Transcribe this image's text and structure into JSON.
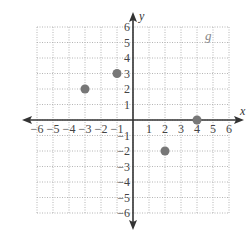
{
  "chart_data": {
    "type": "scatter",
    "title": "",
    "xlabel": "x",
    "ylabel": "y",
    "xlim": [
      -6,
      6
    ],
    "ylim": [
      -6,
      6
    ],
    "grid": true,
    "x_ticks": [
      -6,
      -5,
      -4,
      -3,
      -2,
      -1,
      1,
      2,
      3,
      4,
      5,
      6
    ],
    "y_ticks": [
      -6,
      -5,
      -4,
      -3,
      -2,
      -1,
      1,
      2,
      3,
      4,
      5,
      6
    ],
    "x_tick_labels": [
      "−6",
      "−5",
      "−4",
      "−3",
      "−2",
      "−1",
      "1",
      "2",
      "3",
      "4",
      "5",
      "6"
    ],
    "y_tick_labels": [
      "−6",
      "−5",
      "−4",
      "−3",
      "−2",
      "−1",
      "1",
      "2",
      "3",
      "4",
      "5",
      "6"
    ],
    "annotations": [
      {
        "text": "g",
        "x": 4.5,
        "y": 5.5
      }
    ],
    "series": [
      {
        "name": "g",
        "points": [
          {
            "x": -3,
            "y": 2
          },
          {
            "x": -1,
            "y": 3
          },
          {
            "x": 2,
            "y": -2
          },
          {
            "x": 4,
            "y": 0
          }
        ]
      }
    ]
  },
  "colors": {
    "axis": "#333333",
    "grid": "#b5b5b5",
    "point": "#777777",
    "label": "#444444"
  }
}
